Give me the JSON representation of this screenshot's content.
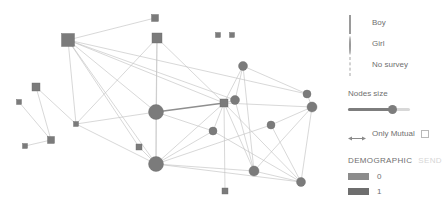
{
  "legend": {
    "items": [
      {
        "label": "Boy",
        "glyph": "square-icon"
      },
      {
        "label": "Girl",
        "glyph": "circle-icon"
      },
      {
        "label": "No survey",
        "glyph": "dashed-square-icon"
      }
    ]
  },
  "controls": {
    "nodes_size_label": "Nodes size",
    "nodes_size_value": 72,
    "mutual_label": "Only Mutual",
    "mutual_checked": false,
    "mutual_arrow_icon": "double-arrow-icon"
  },
  "demographic": {
    "tab_active": "DEMOGRAPHIC",
    "tab_inactive": "SEND",
    "swatches": [
      {
        "label": "0",
        "color": "#8c8c8c"
      },
      {
        "label": "1",
        "color": "#6e6e6e"
      }
    ]
  },
  "chart_data": {
    "type": "scatter",
    "title": "",
    "xlabel": "",
    "ylabel": "",
    "layout": "force-directed network graph",
    "node_color": "#7b7b7b",
    "edge_color": "#c3c3c3",
    "edge_highlight_color": "#8f8f8f",
    "nodes": [
      {
        "id": "n1",
        "x": 68,
        "y": 40,
        "shape": "square",
        "size": 13,
        "group": 1
      },
      {
        "id": "n2",
        "x": 155,
        "y": 18,
        "shape": "square",
        "size": 7,
        "group": 0
      },
      {
        "id": "n3",
        "x": 157,
        "y": 38,
        "shape": "square",
        "size": 10,
        "group": 1
      },
      {
        "id": "n4",
        "x": 218,
        "y": 35,
        "shape": "square",
        "size": 5,
        "group": 0
      },
      {
        "id": "n5",
        "x": 232,
        "y": 35,
        "shape": "square",
        "size": 5,
        "group": 0
      },
      {
        "id": "n6",
        "x": 36,
        "y": 87,
        "shape": "square",
        "size": 8,
        "group": 1
      },
      {
        "id": "n7",
        "x": 19,
        "y": 102,
        "shape": "square",
        "size": 5,
        "group": 0
      },
      {
        "id": "n8",
        "x": 76,
        "y": 124,
        "shape": "square",
        "size": 5,
        "group": 0
      },
      {
        "id": "n9",
        "x": 51,
        "y": 140,
        "shape": "square",
        "size": 7,
        "group": 1
      },
      {
        "id": "n10",
        "x": 25,
        "y": 146,
        "shape": "square",
        "size": 5,
        "group": 0
      },
      {
        "id": "n11",
        "x": 139,
        "y": 147,
        "shape": "square",
        "size": 6,
        "group": 1
      },
      {
        "id": "n12",
        "x": 225,
        "y": 191,
        "shape": "square",
        "size": 6,
        "group": 1
      },
      {
        "id": "n13",
        "x": 224,
        "y": 103,
        "shape": "square",
        "size": 8,
        "group": 1
      },
      {
        "id": "n14",
        "x": 156,
        "y": 112,
        "shape": "circle",
        "size": 15,
        "group": 1
      },
      {
        "id": "n15",
        "x": 156,
        "y": 164,
        "shape": "circle",
        "size": 15,
        "group": 1
      },
      {
        "id": "n16",
        "x": 243,
        "y": 66,
        "shape": "circle",
        "size": 9,
        "group": 1
      },
      {
        "id": "n17",
        "x": 235,
        "y": 100,
        "shape": "circle",
        "size": 9,
        "group": 1
      },
      {
        "id": "n18",
        "x": 213,
        "y": 131,
        "shape": "circle",
        "size": 8,
        "group": 1
      },
      {
        "id": "n19",
        "x": 271,
        "y": 125,
        "shape": "circle",
        "size": 8,
        "group": 1
      },
      {
        "id": "n20",
        "x": 307,
        "y": 94,
        "shape": "circle",
        "size": 8,
        "group": 1
      },
      {
        "id": "n21",
        "x": 312,
        "y": 107,
        "shape": "circle",
        "size": 10,
        "group": 1
      },
      {
        "id": "n22",
        "x": 254,
        "y": 171,
        "shape": "circle",
        "size": 10,
        "group": 1
      },
      {
        "id": "n23",
        "x": 301,
        "y": 182,
        "shape": "circle",
        "size": 9,
        "group": 1
      }
    ],
    "edges": [
      {
        "source": "n1",
        "target": "n2",
        "mutual": false
      },
      {
        "source": "n1",
        "target": "n14",
        "mutual": false
      },
      {
        "source": "n1",
        "target": "n15",
        "mutual": false
      },
      {
        "source": "n1",
        "target": "n13",
        "mutual": false
      },
      {
        "source": "n1",
        "target": "n8",
        "mutual": false
      },
      {
        "source": "n1",
        "target": "n11",
        "mutual": false
      },
      {
        "source": "n1",
        "target": "n17",
        "mutual": false
      },
      {
        "source": "n3",
        "target": "n14",
        "mutual": false
      },
      {
        "source": "n3",
        "target": "n15",
        "mutual": false
      },
      {
        "source": "n3",
        "target": "n13",
        "mutual": false
      },
      {
        "source": "n3",
        "target": "n8",
        "mutual": false
      },
      {
        "source": "n6",
        "target": "n9",
        "mutual": false
      },
      {
        "source": "n6",
        "target": "n8",
        "mutual": false
      },
      {
        "source": "n7",
        "target": "n9",
        "mutual": false
      },
      {
        "source": "n9",
        "target": "n10",
        "mutual": false
      },
      {
        "source": "n8",
        "target": "n14",
        "mutual": false
      },
      {
        "source": "n8",
        "target": "n15",
        "mutual": false
      },
      {
        "source": "n14",
        "target": "n13",
        "mutual": true
      },
      {
        "source": "n14",
        "target": "n15",
        "mutual": false
      },
      {
        "source": "n14",
        "target": "n18",
        "mutual": false
      },
      {
        "source": "n15",
        "target": "n13",
        "mutual": false
      },
      {
        "source": "n15",
        "target": "n11",
        "mutual": false
      },
      {
        "source": "n15",
        "target": "n18",
        "mutual": false
      },
      {
        "source": "n15",
        "target": "n22",
        "mutual": false
      },
      {
        "source": "n15",
        "target": "n23",
        "mutual": false
      },
      {
        "source": "n15",
        "target": "n19",
        "mutual": false
      },
      {
        "source": "n13",
        "target": "n16",
        "mutual": false
      },
      {
        "source": "n13",
        "target": "n17",
        "mutual": false
      },
      {
        "source": "n13",
        "target": "n18",
        "mutual": false
      },
      {
        "source": "n13",
        "target": "n22",
        "mutual": false
      },
      {
        "source": "n13",
        "target": "n23",
        "mutual": false
      },
      {
        "source": "n13",
        "target": "n21",
        "mutual": false
      },
      {
        "source": "n13",
        "target": "n12",
        "mutual": false
      },
      {
        "source": "n16",
        "target": "n17",
        "mutual": false
      },
      {
        "source": "n16",
        "target": "n20",
        "mutual": false
      },
      {
        "source": "n16",
        "target": "n22",
        "mutual": false
      },
      {
        "source": "n17",
        "target": "n22",
        "mutual": false
      },
      {
        "source": "n19",
        "target": "n21",
        "mutual": false
      },
      {
        "source": "n19",
        "target": "n23",
        "mutual": false
      },
      {
        "source": "n20",
        "target": "n21",
        "mutual": false
      },
      {
        "source": "n21",
        "target": "n23",
        "mutual": false
      },
      {
        "source": "n21",
        "target": "n22",
        "mutual": false
      },
      {
        "source": "n22",
        "target": "n23",
        "mutual": false
      },
      {
        "source": "n18",
        "target": "n23",
        "mutual": false
      },
      {
        "source": "n1",
        "target": "n20",
        "mutual": false
      }
    ]
  }
}
